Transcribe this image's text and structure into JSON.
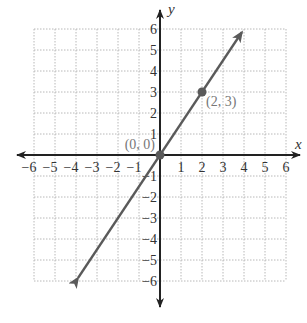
{
  "chart_data": {
    "type": "line",
    "title": "",
    "xlabel": "x",
    "ylabel": "y",
    "xlim": [
      -6,
      6
    ],
    "ylim": [
      -6,
      6
    ],
    "grid": true,
    "x_ticks": [
      "−6",
      "−5",
      "−4",
      "−3",
      "−2",
      "−1",
      "1",
      "2",
      "3",
      "4",
      "5",
      "6"
    ],
    "y_ticks": [
      "6",
      "5",
      "4",
      "3",
      "2",
      "1",
      "−1",
      "−2",
      "−3",
      "−4",
      "−5",
      "−6"
    ],
    "series": [
      {
        "name": "y = 1.5x",
        "x": [
          -3.9,
          0,
          2,
          3.9
        ],
        "y": [
          -5.85,
          0,
          3,
          5.85
        ],
        "arrows_both_ends": true
      }
    ],
    "points": [
      {
        "x": 0,
        "y": 0,
        "label": "(0, 0)"
      },
      {
        "x": 2,
        "y": 3,
        "label": "(2, 3)"
      }
    ],
    "colors": {
      "axis": "#222222",
      "line": "#5a5a5a",
      "grid": "#b8b8b8",
      "point_label": "#777777"
    }
  }
}
